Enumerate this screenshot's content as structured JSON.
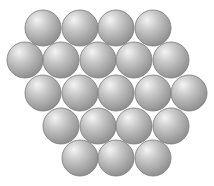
{
  "diagram": {
    "title": "",
    "background": "#ffffff",
    "sphere": {
      "radius": 18,
      "outline_color": "#7a7a7a",
      "highlight_color": "#f4f4f4",
      "mid_color": "#c2c2c2",
      "shadow_color": "#8c8c8c"
    },
    "rows": [
      {
        "count": 4,
        "y": 28,
        "x": [
          43,
          80,
          116,
          153
        ]
      },
      {
        "count": 5,
        "y": 60,
        "x": [
          25,
          61,
          98,
          134,
          171
        ]
      },
      {
        "count": 5,
        "y": 93,
        "x": [
          43,
          80,
          116,
          153,
          189
        ]
      },
      {
        "count": 4,
        "y": 126,
        "x": [
          61,
          98,
          134,
          171
        ]
      },
      {
        "count": 3,
        "y": 158,
        "x": [
          80,
          116,
          153
        ]
      }
    ]
  }
}
